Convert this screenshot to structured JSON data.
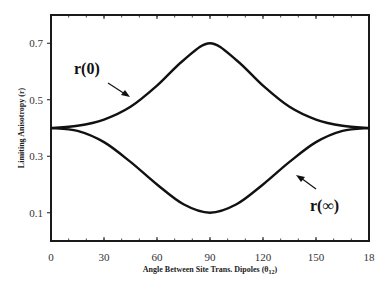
{
  "chart_data": {
    "type": "line",
    "title": "",
    "xlabel": "Angle Between Site Trans. Dipoles (θ12)",
    "xlabel_main": "Angle Between Site Trans. Dipoles (θ",
    "xlabel_sub": "12",
    "xlabel_close": ")",
    "ylabel": "Limiting Anisotropy (r)",
    "xlim": [
      0,
      180
    ],
    "ylim": [
      0,
      0.8
    ],
    "x_ticks": [
      0,
      30,
      60,
      90,
      120,
      150,
      180
    ],
    "x_tick_labels": [
      "0",
      "30",
      "60",
      "90",
      "120",
      "150",
      "18"
    ],
    "y_ticks": [
      0.1,
      0.3,
      0.5,
      0.7
    ],
    "y_tick_labels": [
      "0.1",
      "0.3",
      "0.5",
      "0.7"
    ],
    "grid": false,
    "legend": null,
    "series": [
      {
        "name": "r(0)",
        "x": [
          0,
          15,
          30,
          45,
          60,
          75,
          90,
          105,
          120,
          135,
          150,
          165,
          180
        ],
        "values": [
          0.4,
          0.408,
          0.43,
          0.475,
          0.55,
          0.64,
          0.7,
          0.64,
          0.55,
          0.475,
          0.43,
          0.408,
          0.4
        ]
      },
      {
        "name": "r(∞)",
        "x": [
          0,
          15,
          30,
          45,
          60,
          75,
          90,
          105,
          120,
          135,
          150,
          165,
          180
        ],
        "values": [
          0.4,
          0.39,
          0.35,
          0.28,
          0.2,
          0.13,
          0.1,
          0.13,
          0.2,
          0.28,
          0.35,
          0.39,
          0.4
        ]
      }
    ],
    "annotations": [
      {
        "text": "r(0)",
        "points_to": "upper curve",
        "x": 45,
        "y": 0.63
      },
      {
        "text": "r(∞)",
        "points_to": "lower curve",
        "x": 145,
        "y": 0.14
      }
    ]
  }
}
